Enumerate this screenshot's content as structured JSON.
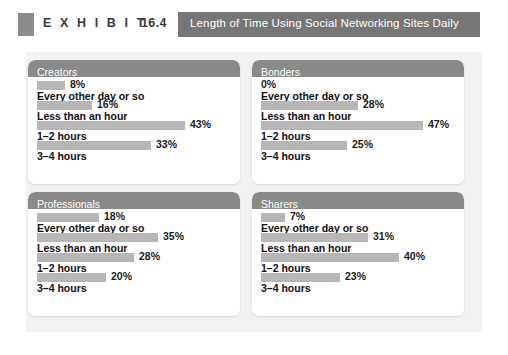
{
  "exhibit": {
    "label": "E X H I B I T",
    "number": "16.4",
    "title": "Length of Time Using Social Networking Sites Daily",
    "marker_icon": "square-marker-icon",
    "title_bar_color": "#767676",
    "marker_color": "#8c8c8c"
  },
  "colors": {
    "canvas_background": "#f1f1f1",
    "panel_background": "#ffffff",
    "panel_header": "#8a8a8a",
    "bar": "#b6b6b6",
    "text": "#111111"
  },
  "chart_data": {
    "type": "bar",
    "title": "Length of Time Using Social Networking Sites Daily",
    "xlabel": "",
    "ylabel": "",
    "xlim": [
      0,
      50
    ],
    "unit": "%",
    "grid": false,
    "legend": "none",
    "orientation": "horizontal",
    "categories": [
      "Every other day or so",
      "Less than an hour",
      "1–2 hours",
      "3–4 hours"
    ],
    "note": "Each panel shows four bars; the bar is drawn above its category label.",
    "panels": [
      {
        "name": "Creators",
        "position": "top-left",
        "values": [
          8,
          16,
          43,
          33
        ],
        "value_labels": [
          "8%",
          "16%",
          "43%",
          "33%"
        ]
      },
      {
        "name": "Bonders",
        "position": "top-right",
        "values": [
          0,
          28,
          47,
          25
        ],
        "value_labels": [
          "0%",
          "28%",
          "47%",
          "25%"
        ]
      },
      {
        "name": "Professionals",
        "position": "bottom-left",
        "values": [
          18,
          35,
          28,
          20
        ],
        "value_labels": [
          "18%",
          "35%",
          "28%",
          "20%"
        ]
      },
      {
        "name": "Sharers",
        "position": "bottom-right",
        "values": [
          7,
          31,
          40,
          23
        ],
        "value_labels": [
          "7%",
          "31%",
          "40%",
          "23%"
        ]
      }
    ]
  }
}
